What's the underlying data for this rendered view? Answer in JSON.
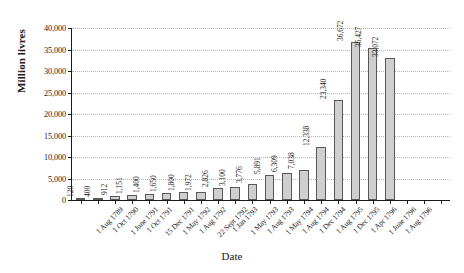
{
  "chart_data": {
    "type": "bar",
    "title": "",
    "xlabel": "Date",
    "ylabel": "Million livres",
    "ylim": [
      0,
      40000
    ],
    "ytick_labels": [
      "0",
      "5,000",
      "10,000",
      "15,000",
      "20,000",
      "25,000",
      "30,000",
      "35,000",
      "40,000"
    ],
    "ytick_values": [
      0,
      5000,
      10000,
      15000,
      20000,
      25000,
      30000,
      35000,
      40000
    ],
    "grid": true,
    "legend": "none",
    "bar_color": "#cfcfcf",
    "bar_edge_color": "#585858",
    "categories": [
      "1 Aug 1789",
      "1 Oct 1790",
      "1 June 1791",
      "1 Oct 1791",
      "15 Dec 1791",
      "1 May 1792",
      "1 Aug 1792",
      "22 Sept 1792",
      "1 Jan 1793",
      "1 May 1793",
      "1 Aug 1793",
      "1 May 1794",
      "1 Aug 1794",
      "1 Dec 1794",
      "1 Aug 1795",
      "1 Dec 1795",
      "1 Apr 1796",
      "1 June 1796",
      "1 Aug 1796"
    ],
    "values": [
      120,
      400,
      912,
      1151,
      1400,
      1650,
      1800,
      1972,
      2826,
      3100,
      3776,
      5891,
      6309,
      7038,
      12338,
      23340,
      36672,
      35427,
      33072
    ],
    "value_labels": [
      "120",
      "400",
      "912",
      "1,151",
      "1,400",
      "1,650",
      "1,800",
      "1,972",
      "2,826",
      "3,100",
      "3,776",
      "5,891",
      "6,309",
      "7,038",
      "12,338",
      "23,340",
      "36,672",
      "35,427",
      "33,072"
    ]
  }
}
